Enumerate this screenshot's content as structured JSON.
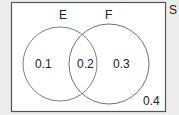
{
  "diagram": {
    "type": "venn",
    "universe_label": "S",
    "sets": [
      {
        "name": "E",
        "label": "E"
      },
      {
        "name": "F",
        "label": "F"
      }
    ],
    "regions": {
      "e_only": "0.1",
      "e_and_f": "0.2",
      "f_only": "0.3",
      "outside": "0.4"
    },
    "colors": {
      "page_background": "#ececec",
      "universe_fill": "#ffffff",
      "universe_stroke": "#555555",
      "circle_stroke": "#777777",
      "text": "#222222"
    }
  }
}
